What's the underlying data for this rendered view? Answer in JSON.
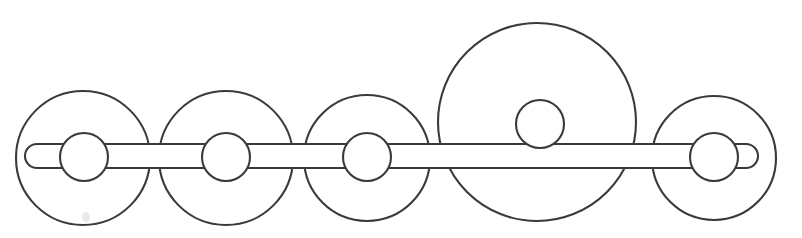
{
  "figure": {
    "title": "Schematic line drawing of a five-wheel axle assembly",
    "background_color": "#ffffff",
    "stroke_color": "#3a3a3a",
    "fill_color": "#ffffff",
    "stroke_width": 2.1,
    "canvas": {
      "width": 802,
      "height": 238
    },
    "axle": {
      "name": "horizontal-axle-bar",
      "x": 25,
      "y": 144,
      "width": 733,
      "height": 24,
      "corner_radius": 12,
      "center_y": 156
    },
    "wheels": [
      {
        "id": "wheel-1",
        "cx": 83,
        "cy": 158,
        "r": 67,
        "hub_cx": 84,
        "hub_cy": 157,
        "hub_r": 24,
        "size": "standard"
      },
      {
        "id": "wheel-2",
        "cx": 226,
        "cy": 158,
        "r": 67,
        "hub_cx": 226,
        "hub_cy": 157,
        "hub_r": 24,
        "size": "standard"
      },
      {
        "id": "wheel-3",
        "cx": 367,
        "cy": 158,
        "r": 63,
        "hub_cx": 367,
        "hub_cy": 157,
        "hub_r": 24,
        "size": "standard"
      },
      {
        "id": "wheel-4",
        "cx": 537,
        "cy": 122,
        "r": 99,
        "hub_cx": 540,
        "hub_cy": 124,
        "hub_r": 24,
        "size": "large"
      },
      {
        "id": "wheel-5",
        "cx": 714,
        "cy": 158,
        "r": 62,
        "hub_cx": 714,
        "hub_cy": 157,
        "hub_r": 24,
        "size": "standard"
      }
    ],
    "wheel_count": 5,
    "hub_count": 5,
    "artifact": {
      "name": "paper-smudge",
      "cx": 86,
      "cy": 217,
      "rx": 4,
      "ry": 5
    }
  }
}
